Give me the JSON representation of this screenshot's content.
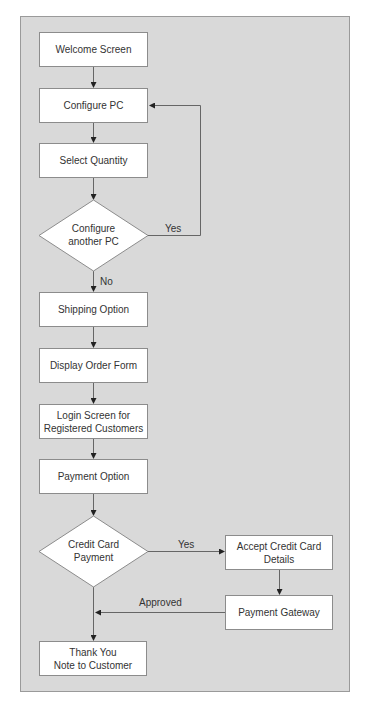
{
  "diagram": {
    "type": "flowchart",
    "nodes": {
      "welcome": "Welcome Screen",
      "configure_pc": "Configure PC",
      "select_quantity": "Select Quantity",
      "configure_another_line1": "Configure",
      "configure_another_line2": "another PC",
      "shipping_option": "Shipping Option",
      "display_order_form": "Display Order Form",
      "login_line1": "Login Screen for",
      "login_line2": "Registered Customers",
      "payment_option": "Payment Option",
      "credit_card_line1": "Credit Card",
      "credit_card_line2": "Payment",
      "accept_cc_line1": "Accept Credit Card",
      "accept_cc_line2": "Details",
      "payment_gateway": "Payment Gateway",
      "thank_you_line1": "Thank You",
      "thank_you_line2": "Note to Customer"
    },
    "edge_labels": {
      "another_yes": "Yes",
      "another_no": "No",
      "credit_yes": "Yes",
      "approved": "Approved"
    },
    "edges": [
      {
        "from": "Welcome Screen",
        "to": "Configure PC"
      },
      {
        "from": "Configure PC",
        "to": "Select Quantity"
      },
      {
        "from": "Select Quantity",
        "to": "Configure another PC"
      },
      {
        "from": "Configure another PC",
        "to": "Configure PC",
        "label": "Yes"
      },
      {
        "from": "Configure another PC",
        "to": "Shipping Option",
        "label": "No"
      },
      {
        "from": "Shipping Option",
        "to": "Display Order Form"
      },
      {
        "from": "Display Order Form",
        "to": "Login Screen for Registered Customers"
      },
      {
        "from": "Login Screen for Registered Customers",
        "to": "Payment Option"
      },
      {
        "from": "Payment Option",
        "to": "Credit Card Payment"
      },
      {
        "from": "Credit Card Payment",
        "to": "Accept Credit Card Details",
        "label": "Yes"
      },
      {
        "from": "Accept Credit Card Details",
        "to": "Payment Gateway"
      },
      {
        "from": "Payment Gateway",
        "to": "Thank You Note to Customer",
        "label": "Approved"
      },
      {
        "from": "Credit Card Payment",
        "to": "Thank You Note to Customer"
      }
    ],
    "colors": {
      "background": "#d9d9d9",
      "node_fill": "#ffffff",
      "line": "#555555",
      "text": "#333333"
    }
  }
}
